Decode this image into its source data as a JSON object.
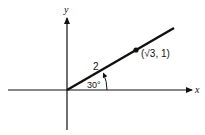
{
  "diagram": {
    "axes": {
      "x_label": "x",
      "y_label": "y"
    },
    "ray": {
      "length_label": "2",
      "angle_label": "30°",
      "angle_degrees": 30
    },
    "point": {
      "label": "(√3, 1)",
      "x": "√3",
      "y": "1"
    },
    "colors": {
      "line": "#111111",
      "background": "#ffffff"
    }
  }
}
